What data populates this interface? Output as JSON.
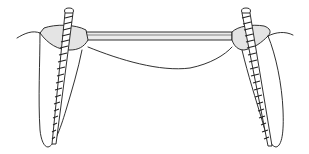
{
  "figure": {
    "colors": {
      "line": "#1a1a1a",
      "shading": "#e4e4e4",
      "background": "#ffffff"
    },
    "elements": [
      {
        "name": "left-tooth",
        "type": "root-with-crown"
      },
      {
        "name": "right-tooth",
        "type": "root-with-crown"
      },
      {
        "name": "left-threaded-post",
        "type": "screw-post"
      },
      {
        "name": "right-threaded-post",
        "type": "screw-post"
      },
      {
        "name": "connecting-bar",
        "type": "bridge-bar"
      },
      {
        "name": "gum-line",
        "type": "curve"
      }
    ]
  }
}
